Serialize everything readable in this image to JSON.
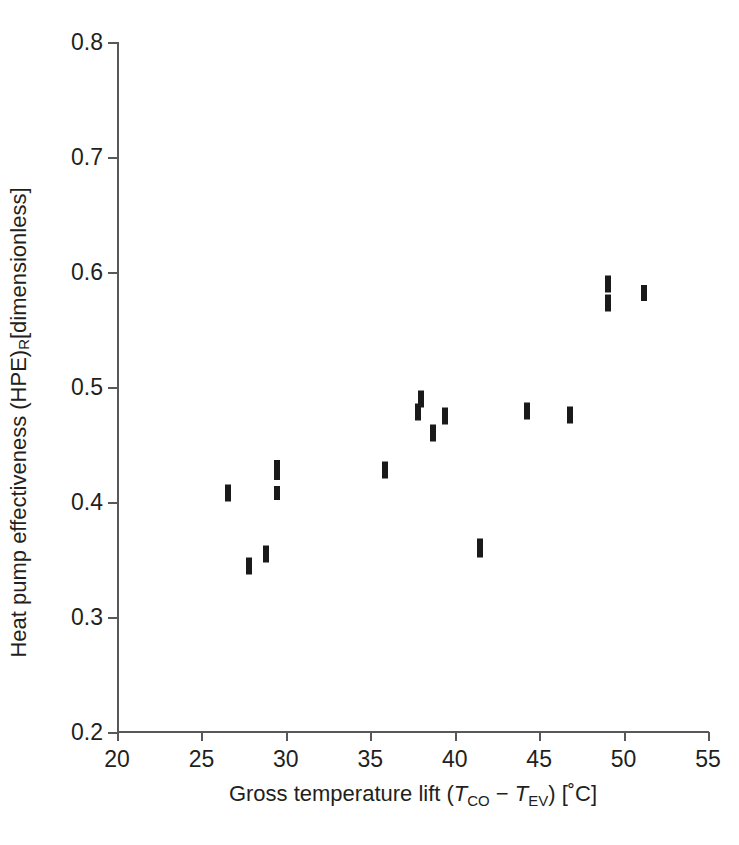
{
  "chart_data": {
    "type": "scatter",
    "title": "",
    "xlabel": "Gross temperature lift (T_CO - T_EV) [°C]",
    "ylabel": "Heat pump effectiveness (HPE)_R [dimensionless]",
    "xlim": [
      20,
      55
    ],
    "ylim": [
      0.2,
      0.8
    ],
    "grid": false,
    "legend": null,
    "xticks": [
      "20",
      "25",
      "30",
      "35",
      "40",
      "45",
      "50",
      "55"
    ],
    "xtick_values": [
      20,
      25,
      30,
      35,
      40,
      45,
      50,
      55
    ],
    "yticks": [
      "0.8",
      "0.7",
      "0.6",
      "0.5",
      "0.4",
      "0.3",
      "0.2"
    ],
    "ytick_values": [
      0.8,
      0.7,
      0.6,
      0.5,
      0.4,
      0.3,
      0.2
    ],
    "marker_style": "vertical-bar",
    "marker_color": "#1a1a1a",
    "points": [
      {
        "x": 26.6,
        "y": 0.408,
        "h": 17
      },
      {
        "x": 27.8,
        "y": 0.344,
        "h": 17
      },
      {
        "x": 28.8,
        "y": 0.355,
        "h": 17
      },
      {
        "x": 29.5,
        "y": 0.428,
        "h": 20
      },
      {
        "x": 29.5,
        "y": 0.408,
        "h": 14
      },
      {
        "x": 35.9,
        "y": 0.428,
        "h": 17
      },
      {
        "x": 38.0,
        "y": 0.49,
        "h": 17
      },
      {
        "x": 37.8,
        "y": 0.478,
        "h": 17
      },
      {
        "x": 39.4,
        "y": 0.475,
        "h": 17
      },
      {
        "x": 38.7,
        "y": 0.46,
        "h": 17
      },
      {
        "x": 41.5,
        "y": 0.36,
        "h": 19
      },
      {
        "x": 44.3,
        "y": 0.479,
        "h": 17
      },
      {
        "x": 46.8,
        "y": 0.476,
        "h": 17
      },
      {
        "x": 49.1,
        "y": 0.59,
        "h": 17
      },
      {
        "x": 49.1,
        "y": 0.573,
        "h": 17
      },
      {
        "x": 51.2,
        "y": 0.582,
        "h": 16
      }
    ]
  },
  "axes": {
    "x_title_parts": {
      "lead": "Gross temperature lift (",
      "sym1": "T",
      "sub1": "CO",
      "minus": " − ",
      "sym2": "T",
      "sub2": "EV",
      "tail": ") [˚C]"
    },
    "y_title_parts": {
      "lead": "Heat pump effectiveness (HPE)",
      "sub": "R",
      "tail": " [dimensionless]"
    }
  },
  "colors": {
    "marker": "#1a1a1a",
    "axis": "#58585a",
    "text": "#231f20",
    "background": "#ffffff"
  }
}
